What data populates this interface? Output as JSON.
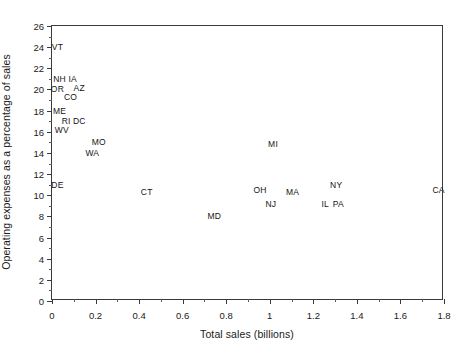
{
  "chart_data": {
    "type": "scatter",
    "title": "",
    "xlabel": "Total sales (billions)",
    "ylabel": "Operating expenses as a percentage of sales",
    "xlim": [
      0,
      1.8
    ],
    "ylim": [
      0,
      26
    ],
    "xticks": [
      "0",
      "0.2",
      "0.4",
      "0.6",
      "0.8",
      "1",
      "1.2",
      "1.4",
      "1.6",
      "1.8"
    ],
    "xtick_values": [
      0,
      0.2,
      0.4,
      0.6,
      0.8,
      1.0,
      1.2,
      1.4,
      1.6,
      1.8
    ],
    "yticks": [
      "0",
      "2",
      "4",
      "6",
      "8",
      "10",
      "12",
      "14",
      "16",
      "18",
      "20",
      "22",
      "24",
      "26"
    ],
    "ytick_values": [
      0,
      2,
      4,
      6,
      8,
      10,
      12,
      14,
      16,
      18,
      20,
      22,
      24,
      26
    ],
    "grid": false,
    "legend": "none",
    "marker_style": "text-label",
    "points": [
      {
        "label": "VT",
        "x": 0.025,
        "y": 24.0
      },
      {
        "label": "NH",
        "x": 0.035,
        "y": 21.0
      },
      {
        "label": "IA",
        "x": 0.095,
        "y": 21.0
      },
      {
        "label": "OR",
        "x": 0.025,
        "y": 20.0
      },
      {
        "label": "AZ",
        "x": 0.125,
        "y": 20.1
      },
      {
        "label": "CO",
        "x": 0.085,
        "y": 19.3
      },
      {
        "label": "ME",
        "x": 0.035,
        "y": 18.0
      },
      {
        "label": "RI",
        "x": 0.065,
        "y": 17.0
      },
      {
        "label": "DC",
        "x": 0.125,
        "y": 17.0
      },
      {
        "label": "WV",
        "x": 0.045,
        "y": 16.2
      },
      {
        "label": "MO",
        "x": 0.215,
        "y": 15.0
      },
      {
        "label": "WA",
        "x": 0.185,
        "y": 14.0
      },
      {
        "label": "MI",
        "x": 1.015,
        "y": 14.8
      },
      {
        "label": "DE",
        "x": 0.025,
        "y": 11.0
      },
      {
        "label": "CT",
        "x": 0.435,
        "y": 10.3
      },
      {
        "label": "NY",
        "x": 1.305,
        "y": 11.0
      },
      {
        "label": "CA",
        "x": 1.775,
        "y": 10.5
      },
      {
        "label": "OH",
        "x": 0.955,
        "y": 10.5
      },
      {
        "label": "MA",
        "x": 1.105,
        "y": 10.3
      },
      {
        "label": "NJ",
        "x": 1.005,
        "y": 9.2
      },
      {
        "label": "IL",
        "x": 1.255,
        "y": 9.2
      },
      {
        "label": "PA",
        "x": 1.315,
        "y": 9.2
      },
      {
        "label": "MD",
        "x": 0.745,
        "y": 8.0
      }
    ]
  }
}
